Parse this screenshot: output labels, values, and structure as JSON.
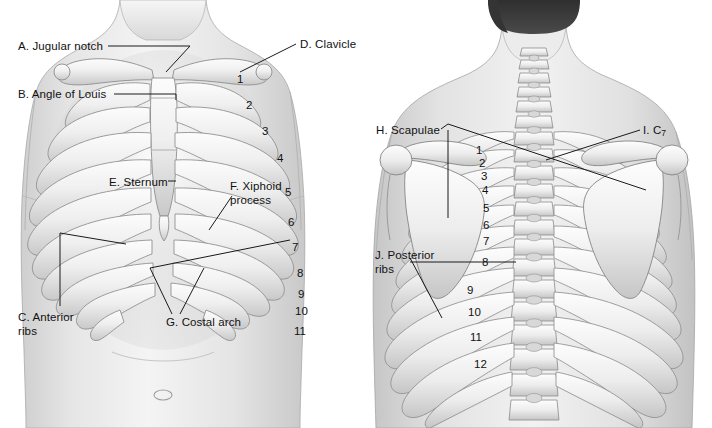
{
  "figure": {
    "background_color": "#ffffff",
    "label_color": "#111111",
    "leader_color": "#1a1a1a"
  },
  "panels": [
    {
      "id": "anterior",
      "view_name": "Anterior view",
      "labels": [
        {
          "key": "A",
          "text": "A. Jugular notch",
          "x": 18,
          "y": 40,
          "lines": [
            "A. Jugular notch"
          ]
        },
        {
          "key": "B",
          "text": "B. Angle of Louis",
          "x": 18,
          "y": 88,
          "lines": [
            "B. Angle of Louis"
          ]
        },
        {
          "key": "D",
          "text": "D. Clavicle",
          "x": 300,
          "y": 38,
          "lines": [
            "D. Clavicle"
          ]
        },
        {
          "key": "E",
          "text": "E. Sternum",
          "x": 109,
          "y": 176,
          "lines": [
            "E. Sternum"
          ]
        },
        {
          "key": "F",
          "text": "F. Xiphoid process",
          "x": 230,
          "y": 180,
          "lines": [
            "F. Xiphoid",
            "process"
          ]
        },
        {
          "key": "C",
          "text": "C. Anterior ribs",
          "x": 18,
          "y": 311,
          "lines": [
            "C. Anterior",
            "ribs"
          ]
        },
        {
          "key": "G",
          "text": "G. Costal arch",
          "x": 166,
          "y": 316,
          "lines": [
            "G. Costal arch"
          ]
        }
      ],
      "rib_numbers": [
        {
          "label": "1",
          "x": 237,
          "y": 73
        },
        {
          "label": "2",
          "x": 246,
          "y": 99
        },
        {
          "label": "3",
          "x": 262,
          "y": 125
        },
        {
          "label": "4",
          "x": 277,
          "y": 152
        },
        {
          "label": "5",
          "x": 285,
          "y": 186
        },
        {
          "label": "6",
          "x": 288,
          "y": 216
        },
        {
          "label": "7",
          "x": 292,
          "y": 241
        },
        {
          "label": "8",
          "x": 297,
          "y": 267
        },
        {
          "label": "9",
          "x": 298,
          "y": 288
        },
        {
          "label": "10",
          "x": 297,
          "y": 305
        },
        {
          "label": "11",
          "x": 296,
          "y": 325
        }
      ]
    },
    {
      "id": "posterior",
      "view_name": "Posterior view",
      "labels": [
        {
          "key": "H",
          "text": "H. Scapulae",
          "x": 376,
          "y": 124,
          "lines": [
            "H. Scapulae"
          ]
        },
        {
          "key": "I",
          "text": "I. C7",
          "x": 643,
          "y": 124,
          "lines": [
            "I. C7"
          ],
          "subscript": "7",
          "prefix": "I. C"
        },
        {
          "key": "J",
          "text": "J. Posterior ribs",
          "x": 375,
          "y": 249,
          "lines": [
            "J. Posterior",
            "ribs"
          ]
        }
      ],
      "rib_numbers": [
        {
          "label": "1",
          "x": 476,
          "y": 150
        },
        {
          "label": "2",
          "x": 479,
          "y": 163
        },
        {
          "label": "3",
          "x": 481,
          "y": 176
        },
        {
          "label": "4",
          "x": 482,
          "y": 190
        },
        {
          "label": "5",
          "x": 483,
          "y": 208
        },
        {
          "label": "6",
          "x": 483,
          "y": 225
        },
        {
          "label": "7",
          "x": 483,
          "y": 241
        },
        {
          "label": "8",
          "x": 482,
          "y": 262
        },
        {
          "label": "9",
          "x": 467,
          "y": 290
        },
        {
          "label": "10",
          "x": 470,
          "y": 312
        },
        {
          "label": "11",
          "x": 472,
          "y": 337
        },
        {
          "label": "12",
          "x": 476,
          "y": 364
        }
      ]
    }
  ],
  "colors": {
    "skin_light": "#f2f2f2",
    "skin_mid": "#dcdcdc",
    "skin_shadow": "#c4c4c4",
    "bone_light": "#fbfbfb",
    "bone_mid": "#e3e3e3",
    "bone_edge": "#8d8d8d",
    "hair_dark": "#3a3a3a",
    "outline": "#7a7a7a"
  }
}
